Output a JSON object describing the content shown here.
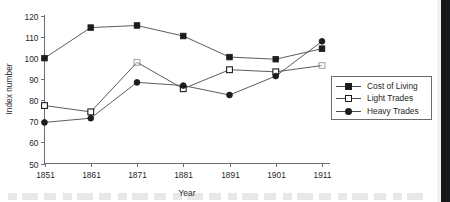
{
  "chart_data": {
    "type": "line",
    "title": "",
    "xlabel": "Year",
    "ylabel": "Index number",
    "x": [
      1851,
      1861,
      1871,
      1881,
      1891,
      1901,
      1911
    ],
    "xtick_labels": [
      "1851",
      "1861",
      "1871",
      "1881",
      "1891",
      "1901",
      "1911"
    ],
    "ytick_labels": [
      "50",
      "60",
      "70",
      "80",
      "90",
      "100",
      "110",
      "120"
    ],
    "yticks": [
      50,
      60,
      70,
      80,
      90,
      100,
      110,
      120
    ],
    "ylim": [
      50,
      120
    ],
    "xlim": [
      1851,
      1911
    ],
    "grid": false,
    "legend_position": "right",
    "series": [
      {
        "name": "Cost of Living",
        "marker": "filled-square",
        "values": [
          100,
          114.5,
          115.5,
          110.5,
          100.5,
          99.5,
          104.5
        ]
      },
      {
        "name": "Light Trades",
        "marker": "open-square",
        "values": [
          77.5,
          74.5,
          98,
          85.5,
          94.5,
          93.5,
          96.5
        ]
      },
      {
        "name": "Heavy Trades",
        "marker": "filled-circle",
        "values": [
          69.5,
          71.5,
          88.5,
          87,
          82.5,
          91.5,
          108
        ]
      }
    ]
  },
  "legend": {
    "items": [
      {
        "label": "Cost of Living",
        "marker": "filled-square"
      },
      {
        "label": "Light Trades",
        "marker": "open-square"
      },
      {
        "label": "Heavy Trades",
        "marker": "filled-circle"
      }
    ]
  }
}
